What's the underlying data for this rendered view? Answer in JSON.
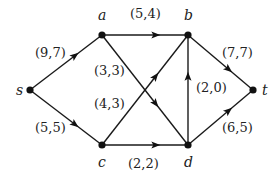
{
  "diagram": {
    "type": "flow-network",
    "nodes": [
      {
        "id": "s",
        "label": "s",
        "x": 30,
        "y": 90,
        "lx": 16,
        "ly": 95
      },
      {
        "id": "a",
        "label": "a",
        "x": 102,
        "y": 35,
        "lx": 98,
        "ly": 20
      },
      {
        "id": "b",
        "label": "b",
        "x": 188,
        "y": 35,
        "lx": 184,
        "ly": 20
      },
      {
        "id": "c",
        "label": "c",
        "x": 102,
        "y": 145,
        "lx": 98,
        "ly": 167
      },
      {
        "id": "d",
        "label": "d",
        "x": 188,
        "y": 145,
        "lx": 184,
        "ly": 167
      },
      {
        "id": "t",
        "label": "t",
        "x": 253,
        "y": 90,
        "lx": 262,
        "ly": 95
      }
    ],
    "edges": [
      {
        "from": "s",
        "to": "a",
        "label": "(9,7)",
        "capacity": 9,
        "flow": 7,
        "lx": 35,
        "ly": 57
      },
      {
        "from": "s",
        "to": "c",
        "label": "(5,5)",
        "capacity": 5,
        "flow": 5,
        "lx": 35,
        "ly": 132
      },
      {
        "from": "a",
        "to": "b",
        "label": "(5,4)",
        "capacity": 5,
        "flow": 4,
        "lx": 130,
        "ly": 18
      },
      {
        "from": "a",
        "to": "d",
        "label": "(3,3)",
        "capacity": 3,
        "flow": 3,
        "lx": 94,
        "ly": 75
      },
      {
        "from": "c",
        "to": "b",
        "label": "(4,3)",
        "capacity": 4,
        "flow": 3,
        "lx": 94,
        "ly": 108
      },
      {
        "from": "c",
        "to": "d",
        "label": "(2,2)",
        "capacity": 2,
        "flow": 2,
        "lx": 128,
        "ly": 168
      },
      {
        "from": "d",
        "to": "b",
        "label": "(2,0)",
        "capacity": 2,
        "flow": 0,
        "lx": 196,
        "ly": 92
      },
      {
        "from": "b",
        "to": "t",
        "label": "(7,7)",
        "capacity": 7,
        "flow": 7,
        "lx": 222,
        "ly": 57
      },
      {
        "from": "d",
        "to": "t",
        "label": "(6,5)",
        "capacity": 6,
        "flow": 5,
        "lx": 222,
        "ly": 132
      }
    ]
  }
}
